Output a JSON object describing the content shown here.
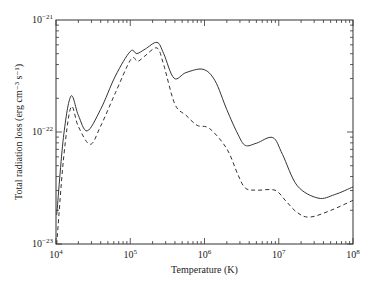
{
  "chart_data": {
    "type": "line",
    "title": "",
    "xlabel": "Temperature (K)",
    "ylabel": "Total radiation loss (erg cm⁻³ s⁻¹)",
    "xscale": "log",
    "yscale": "log",
    "xlim": [
      10000.0,
      100000000.0
    ],
    "ylim": [
      1e-23,
      1e-21
    ],
    "grid": false,
    "legend": null,
    "x_ticks": [
      {
        "value": 10000.0,
        "base": "10",
        "exp": "4"
      },
      {
        "value": 100000.0,
        "base": "10",
        "exp": "5"
      },
      {
        "value": 1000000.0,
        "base": "10",
        "exp": "6"
      },
      {
        "value": 10000000.0,
        "base": "10",
        "exp": "7"
      },
      {
        "value": 100000000.0,
        "base": "10",
        "exp": "8"
      }
    ],
    "y_ticks": [
      {
        "value": 1e-21,
        "base": "10",
        "exp": "−21"
      },
      {
        "value": 1e-22,
        "base": "10",
        "exp": "−22"
      },
      {
        "value": 1e-23,
        "base": "10",
        "exp": "−23"
      }
    ],
    "series": [
      {
        "name": "solid",
        "style": "solid",
        "log10_T": [
          4.01,
          4.1,
          4.2,
          4.3,
          4.42,
          4.6,
          4.8,
          5.0,
          5.09,
          5.2,
          5.36,
          5.45,
          5.59,
          5.75,
          5.98,
          6.14,
          6.3,
          6.45,
          6.55,
          6.7,
          6.92,
          7.05,
          7.25,
          7.53,
          7.75,
          8.0
        ],
        "log10_L": [
          -22.74,
          -22.05,
          -21.68,
          -21.85,
          -21.99,
          -21.8,
          -21.5,
          -21.28,
          -21.3,
          -21.26,
          -21.2,
          -21.3,
          -21.52,
          -21.47,
          -21.44,
          -21.54,
          -21.8,
          -22.02,
          -22.12,
          -22.1,
          -22.05,
          -22.2,
          -22.48,
          -22.59,
          -22.56,
          -22.49
        ]
      },
      {
        "name": "dashed",
        "style": "dashed",
        "log10_T": [
          4.01,
          4.1,
          4.2,
          4.3,
          4.46,
          4.6,
          4.8,
          5.01,
          5.1,
          5.2,
          5.36,
          5.45,
          5.6,
          5.75,
          5.9,
          6.07,
          6.3,
          6.45,
          6.55,
          6.7,
          6.95,
          7.1,
          7.25,
          7.42,
          7.7,
          8.0
        ],
        "log10_L": [
          -23.0,
          -22.25,
          -21.78,
          -21.95,
          -22.11,
          -21.95,
          -21.65,
          -21.35,
          -21.37,
          -21.32,
          -21.25,
          -21.4,
          -21.75,
          -21.85,
          -21.94,
          -21.97,
          -22.15,
          -22.38,
          -22.5,
          -22.52,
          -22.52,
          -22.62,
          -22.72,
          -22.76,
          -22.7,
          -22.61
        ]
      }
    ]
  },
  "layout": {
    "plot": {
      "left": 56,
      "top": 20,
      "right": 353,
      "bottom": 244
    },
    "line_color": "#333333"
  }
}
